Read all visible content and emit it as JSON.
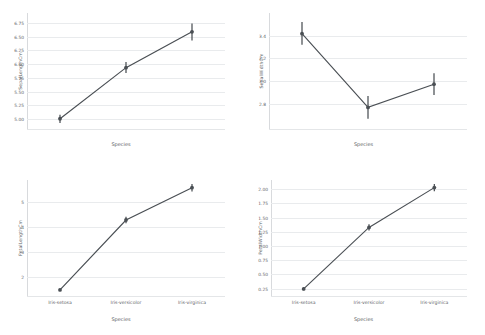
{
  "figure": {
    "background": "#ffffff",
    "series_color": "#4a4f54",
    "grid_color": "#e9ebed",
    "layout": "2x2 grid of point plots"
  },
  "chart_data": [
    {
      "type": "line",
      "id": "sepal-length",
      "title": "",
      "xlabel": "Species",
      "ylabel": "SepalLengthCm",
      "categories": [
        "Iris-setosa",
        "Iris-versicolor",
        "Iris-virginica"
      ],
      "show_xticklabels": false,
      "values": [
        5.006,
        5.936,
        6.588
      ],
      "err_low": [
        4.93,
        5.84,
        6.43
      ],
      "err_high": [
        5.08,
        6.04,
        6.74
      ],
      "yticks": [
        5.0,
        5.25,
        5.5,
        5.75,
        6.0,
        6.25,
        6.5,
        6.75
      ],
      "yticklabels": [
        "5.00",
        "5.25",
        "5.50",
        "5.75",
        "6.00",
        "6.25",
        "6.50",
        "6.75"
      ],
      "ylim": [
        4.82,
        6.93
      ],
      "grid": true,
      "legend": "none"
    },
    {
      "type": "line",
      "id": "sepal-width",
      "title": "",
      "xlabel": "Species",
      "ylabel": "SepalWidthCm",
      "categories": [
        "Iris-setosa",
        "Iris-versicolor",
        "Iris-virginica"
      ],
      "show_xticklabels": false,
      "values": [
        3.418,
        2.77,
        2.974
      ],
      "err_low": [
        3.32,
        2.67,
        2.88
      ],
      "err_high": [
        3.52,
        2.87,
        3.07
      ],
      "yticks": [
        2.8,
        3.0,
        3.2,
        3.4
      ],
      "yticklabels": [
        "2.8",
        "3.0",
        "3.2",
        "3.4"
      ],
      "ylim": [
        2.58,
        3.6
      ],
      "grid": true,
      "legend": "none"
    },
    {
      "type": "line",
      "id": "petal-length",
      "title": "",
      "xlabel": "Species",
      "ylabel": "PetalLengthCm",
      "categories": [
        "Iris-setosa",
        "Iris-versicolor",
        "Iris-virginica"
      ],
      "show_xticklabels": true,
      "values": [
        1.464,
        4.26,
        5.552
      ],
      "err_low": [
        1.42,
        4.13,
        5.4
      ],
      "err_high": [
        1.51,
        4.39,
        5.7
      ],
      "yticks": [
        2,
        3,
        4,
        5
      ],
      "yticklabels": [
        "2",
        "3",
        "4",
        "5"
      ],
      "ylim": [
        1.22,
        5.86
      ],
      "grid": true,
      "legend": "none"
    },
    {
      "type": "line",
      "id": "petal-width",
      "title": "",
      "xlabel": "Species",
      "ylabel": "PetalWidthCm",
      "categories": [
        "Iris-setosa",
        "Iris-versicolor",
        "Iris-virginica"
      ],
      "show_xticklabels": true,
      "values": [
        0.244,
        1.326,
        2.026
      ],
      "err_low": [
        0.22,
        1.27,
        1.96
      ],
      "err_high": [
        0.27,
        1.38,
        2.09
      ],
      "yticks": [
        0.25,
        0.5,
        0.75,
        1.0,
        1.25,
        1.5,
        1.75,
        2.0
      ],
      "yticklabels": [
        "0.25",
        "0.50",
        "0.75",
        "1.00",
        "1.25",
        "1.50",
        "1.75",
        "2.00"
      ],
      "ylim": [
        0.12,
        2.16
      ],
      "grid": true,
      "legend": "none"
    }
  ]
}
